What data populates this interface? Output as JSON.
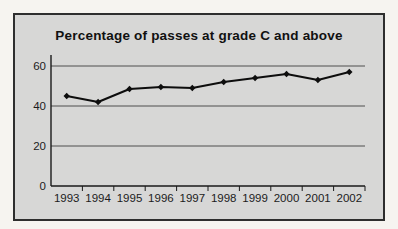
{
  "page": {
    "background": "#f6f4f0"
  },
  "chart": {
    "title": "Percentage of passes at grade C and above",
    "frame_fill": "#d7d7d6",
    "frame_border": "#2e2e2e",
    "grid_color": "#4f4f4f",
    "axis_color": "#1a1a1a",
    "label_color": "#1c1c1c",
    "line_color": "#0d0d0d",
    "marker_color": "#0d0d0d"
  },
  "chart_data": {
    "type": "line",
    "title": "Percentage of passes at grade C and above",
    "categories": [
      "1993",
      "1994",
      "1995",
      "1996",
      "1997",
      "1998",
      "1999",
      "2000",
      "2001",
      "2002"
    ],
    "series": [
      {
        "name": "Percentage of passes at grade C and above",
        "values": [
          45,
          42,
          48.5,
          49.5,
          49,
          52,
          54,
          56,
          53,
          57
        ]
      }
    ],
    "xlabel": "",
    "ylabel": "",
    "ylim": [
      0,
      60
    ],
    "yticks": [
      0,
      20,
      40,
      60
    ],
    "grid": true,
    "legend": false,
    "marker": "diamond"
  }
}
